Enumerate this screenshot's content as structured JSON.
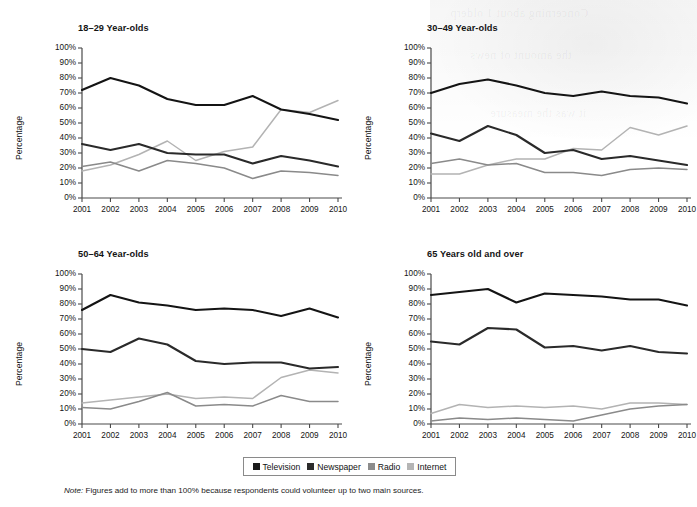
{
  "figure": {
    "note_label": "Note:",
    "note_text": " Figures add to more than 100% because respondents could volunteer up to two main sources.",
    "ylabel": "Percentage",
    "ytick_labels": [
      "100%",
      "90%",
      "80%",
      "70%",
      "60%",
      "50%",
      "40%",
      "30%",
      "20%",
      "10%",
      "0%"
    ],
    "xtick_labels": [
      "2001",
      "2002",
      "2003",
      "2004",
      "2005",
      "2006",
      "2007",
      "2008",
      "2009",
      "2010"
    ]
  },
  "legend": {
    "items": [
      {
        "label": "Television",
        "color": "#1a1a1a"
      },
      {
        "label": "Newspaper",
        "color": "#2b2b2b"
      },
      {
        "label": "Radio",
        "color": "#8c8c8c"
      },
      {
        "label": "Internet",
        "color": "#b5b5b5"
      }
    ]
  },
  "series_colors": {
    "television": "#141414",
    "newspaper": "#2a2a2a",
    "radio": "#8a8a8a",
    "internet": "#b3b3b3"
  },
  "chart_data": [
    {
      "type": "line",
      "title": "18–29 Year-olds",
      "xlabel": "",
      "ylabel": "Percentage",
      "ylim": [
        0,
        100
      ],
      "grid": false,
      "legend_position": "bottom-outside",
      "x": [
        2001,
        2002,
        2003,
        2004,
        2005,
        2006,
        2007,
        2008,
        2009,
        2010
      ],
      "series": [
        {
          "name": "Television",
          "values": [
            72,
            80,
            75,
            66,
            62,
            62,
            68,
            59,
            56,
            52
          ]
        },
        {
          "name": "Newspaper",
          "values": [
            36,
            32,
            36,
            30,
            29,
            29,
            23,
            28,
            25,
            21
          ]
        },
        {
          "name": "Radio",
          "values": [
            21,
            24,
            18,
            25,
            23,
            20,
            13,
            18,
            17,
            15
          ]
        },
        {
          "name": "Internet",
          "values": [
            18,
            22,
            29,
            38,
            25,
            31,
            34,
            59,
            57,
            65
          ]
        }
      ]
    },
    {
      "type": "line",
      "title": "30–49 Year-olds",
      "xlabel": "",
      "ylabel": "Percentage",
      "ylim": [
        0,
        100
      ],
      "grid": false,
      "legend_position": "bottom-outside",
      "x": [
        2001,
        2002,
        2003,
        2004,
        2005,
        2006,
        2007,
        2008,
        2009,
        2010
      ],
      "series": [
        {
          "name": "Television",
          "values": [
            70,
            76,
            79,
            75,
            70,
            68,
            71,
            68,
            67,
            63
          ]
        },
        {
          "name": "Newspaper",
          "values": [
            43,
            38,
            48,
            42,
            30,
            32,
            26,
            28,
            25,
            22
          ]
        },
        {
          "name": "Radio",
          "values": [
            23,
            26,
            22,
            23,
            17,
            17,
            15,
            19,
            20,
            19
          ]
        },
        {
          "name": "Internet",
          "values": [
            16,
            16,
            22,
            26,
            26,
            33,
            32,
            47,
            42,
            48
          ]
        }
      ]
    },
    {
      "type": "line",
      "title": "50–64 Year-olds",
      "xlabel": "",
      "ylabel": "Percentage",
      "ylim": [
        0,
        100
      ],
      "grid": false,
      "legend_position": "bottom-outside",
      "x": [
        2001,
        2002,
        2003,
        2004,
        2005,
        2006,
        2007,
        2008,
        2009,
        2010
      ],
      "series": [
        {
          "name": "Television",
          "values": [
            76,
            86,
            81,
            79,
            76,
            77,
            76,
            72,
            77,
            71
          ]
        },
        {
          "name": "Newspaper",
          "values": [
            50,
            48,
            57,
            53,
            42,
            40,
            41,
            41,
            37,
            38
          ]
        },
        {
          "name": "Radio",
          "values": [
            11,
            10,
            15,
            21,
            12,
            13,
            12,
            19,
            15,
            15
          ]
        },
        {
          "name": "Internet",
          "values": [
            14,
            16,
            18,
            20,
            17,
            18,
            17,
            31,
            36,
            34
          ]
        }
      ]
    },
    {
      "type": "line",
      "title": "65 Years old and over",
      "xlabel": "",
      "ylabel": "Percentage",
      "ylim": [
        0,
        100
      ],
      "grid": false,
      "legend_position": "bottom-outside",
      "x": [
        2001,
        2002,
        2003,
        2004,
        2005,
        2006,
        2007,
        2008,
        2009,
        2010
      ],
      "series": [
        {
          "name": "Television",
          "values": [
            86,
            88,
            90,
            81,
            87,
            86,
            85,
            83,
            83,
            79
          ]
        },
        {
          "name": "Newspaper",
          "values": [
            55,
            53,
            64,
            63,
            51,
            52,
            49,
            52,
            48,
            47
          ]
        },
        {
          "name": "Radio",
          "values": [
            2,
            4,
            3,
            4,
            3,
            2,
            6,
            10,
            12,
            13
          ]
        },
        {
          "name": "Internet",
          "values": [
            7,
            13,
            11,
            12,
            11,
            12,
            10,
            14,
            14,
            13
          ]
        }
      ]
    }
  ],
  "bleed_lines": [
    "Concerning about 1 olderp",
    "the amount of news",
    "it was the measure"
  ]
}
